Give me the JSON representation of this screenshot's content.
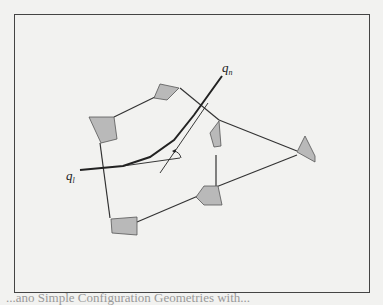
{
  "figure": {
    "labels": {
      "q_n": {
        "base": "q",
        "sub": "n"
      },
      "q_l": {
        "base": "q",
        "sub": "l"
      }
    },
    "caption_fragment": "...ano Simple Configuration Geometries with...",
    "colors": {
      "obstacle_fill": "#b9b9b9",
      "line": "#333333",
      "frame": "#444444",
      "paper": "#f2f2f0"
    }
  }
}
